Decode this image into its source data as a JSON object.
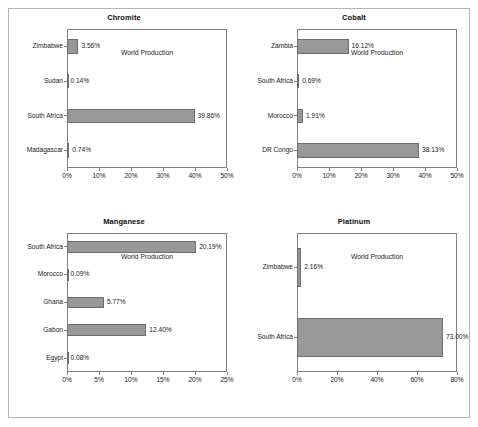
{
  "figure": {
    "background": "#ffffff",
    "border_color": "#b4b4b4",
    "bar_color": "#989898",
    "axis_color": "#808080"
  },
  "charts": [
    {
      "title": "Chromite",
      "xlabel": "World Production",
      "ticks": [
        "0%",
        "10%",
        "20%",
        "30%",
        "40%",
        "50%"
      ],
      "tick_values": [
        0,
        10,
        20,
        30,
        40,
        50
      ],
      "xlim": [
        0,
        50
      ],
      "categories": [
        "Zimbabwe",
        "Sudan",
        "South Africa",
        "Madagascar"
      ],
      "values": [
        3.56,
        0.14,
        39.86,
        0.74
      ],
      "labels": [
        "3.56%",
        "0.14%",
        "39.86%",
        "0.74%"
      ]
    },
    {
      "title": "Cobalt",
      "xlabel": "World Production",
      "ticks": [
        "0%",
        "10%",
        "20%",
        "30%",
        "40%",
        "50%"
      ],
      "tick_values": [
        0,
        10,
        20,
        30,
        40,
        50
      ],
      "xlim": [
        0,
        50
      ],
      "categories": [
        "Zambia",
        "South Africa",
        "Morocco",
        "DR Congo"
      ],
      "values": [
        16.12,
        0.69,
        1.91,
        38.13
      ],
      "labels": [
        "16.12%",
        "0.69%",
        "1.91%",
        "38.13%"
      ]
    },
    {
      "title": "Manganese",
      "xlabel": "World Production",
      "ticks": [
        "0%",
        "5%",
        "10%",
        "15%",
        "20%",
        "25%"
      ],
      "tick_values": [
        0,
        5,
        10,
        15,
        20,
        25
      ],
      "xlim": [
        0,
        25
      ],
      "categories": [
        "South Africa",
        "Morocco",
        "Ghana",
        "Gabon",
        "Egypt"
      ],
      "values": [
        20.19,
        0.09,
        5.77,
        12.4,
        0.08
      ],
      "labels": [
        "20.19%",
        "0.09%",
        "5.77%",
        "12.40%",
        "0.08%"
      ]
    },
    {
      "title": "Platinum",
      "xlabel": "World Production",
      "ticks": [
        "0%",
        "20%",
        "40%",
        "60%",
        "80%"
      ],
      "tick_values": [
        0,
        20,
        40,
        60,
        80
      ],
      "xlim": [
        0,
        80
      ],
      "categories": [
        "Zimbabwe",
        "South Africa"
      ],
      "values": [
        2.16,
        73.0
      ],
      "labels": [
        "2.16%",
        "73.00%"
      ]
    }
  ],
  "chart_data": [
    {
      "type": "bar",
      "orientation": "horizontal",
      "title": "Chromite",
      "xlabel": "World Production",
      "ylabel": "",
      "categories": [
        "Zimbabwe",
        "Sudan",
        "South Africa",
        "Madagascar"
      ],
      "values": [
        3.56,
        0.14,
        39.86,
        0.74
      ],
      "data_labels": [
        "3.56%",
        "0.14%",
        "39.86%",
        "0.74%"
      ],
      "xlim": [
        0,
        50
      ],
      "xticks": [
        0,
        10,
        20,
        30,
        40,
        50
      ],
      "xticklabels": [
        "0%",
        "10%",
        "20%",
        "30%",
        "40%",
        "50%"
      ],
      "grid": false,
      "legend": false
    },
    {
      "type": "bar",
      "orientation": "horizontal",
      "title": "Cobalt",
      "xlabel": "World Production",
      "ylabel": "",
      "categories": [
        "Zambia",
        "South Africa",
        "Morocco",
        "DR Congo"
      ],
      "values": [
        16.12,
        0.69,
        1.91,
        38.13
      ],
      "data_labels": [
        "16.12%",
        "0.69%",
        "1.91%",
        "38.13%"
      ],
      "xlim": [
        0,
        50
      ],
      "xticks": [
        0,
        10,
        20,
        30,
        40,
        50
      ],
      "xticklabels": [
        "0%",
        "10%",
        "20%",
        "30%",
        "40%",
        "50%"
      ],
      "grid": false,
      "legend": false
    },
    {
      "type": "bar",
      "orientation": "horizontal",
      "title": "Manganese",
      "xlabel": "World Production",
      "ylabel": "",
      "categories": [
        "South Africa",
        "Morocco",
        "Ghana",
        "Gabon",
        "Egypt"
      ],
      "values": [
        20.19,
        0.09,
        5.77,
        12.4,
        0.08
      ],
      "data_labels": [
        "20.19%",
        "0.09%",
        "5.77%",
        "12.40%",
        "0.08%"
      ],
      "xlim": [
        0,
        25
      ],
      "xticks": [
        0,
        5,
        10,
        15,
        20,
        25
      ],
      "xticklabels": [
        "0%",
        "5%",
        "10%",
        "15%",
        "20%",
        "25%"
      ],
      "grid": false,
      "legend": false
    },
    {
      "type": "bar",
      "orientation": "horizontal",
      "title": "Platinum",
      "xlabel": "World Production",
      "ylabel": "",
      "categories": [
        "Zimbabwe",
        "South Africa"
      ],
      "values": [
        2.16,
        73.0
      ],
      "data_labels": [
        "2.16%",
        "73.00%"
      ],
      "xlim": [
        0,
        80
      ],
      "xticks": [
        0,
        20,
        40,
        60,
        80
      ],
      "xticklabels": [
        "0%",
        "20%",
        "40%",
        "60%",
        "80%"
      ],
      "grid": false,
      "legend": false
    }
  ]
}
